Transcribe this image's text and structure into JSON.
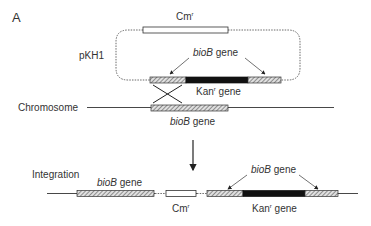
{
  "panel_label": "A",
  "plasmid": {
    "name": "pKH1",
    "cm_label": "Cm",
    "cm_sup": "r",
    "bioB_label_italic": "bioB",
    "bioB_label_suffix": " gene",
    "kan_label": "Kan",
    "kan_sup": "r",
    "kan_suffix": " gene"
  },
  "chromosome": {
    "label": "Chromosome",
    "bioB_label_italic": "bioB",
    "bioB_label_suffix": " gene"
  },
  "integration": {
    "label": "Integration",
    "bioB_left_italic": "bioB",
    "bioB_left_suffix": " gene",
    "cm_label": "Cm",
    "cm_sup": "r",
    "bioB_right_italic": "bioB",
    "bioB_right_suffix": " gene",
    "kan_label": "Kan",
    "kan_sup": "r",
    "kan_suffix": " gene"
  },
  "colors": {
    "line": "#333333",
    "black_segment": "#111111",
    "hatch_bg": "#d8d8d8"
  }
}
